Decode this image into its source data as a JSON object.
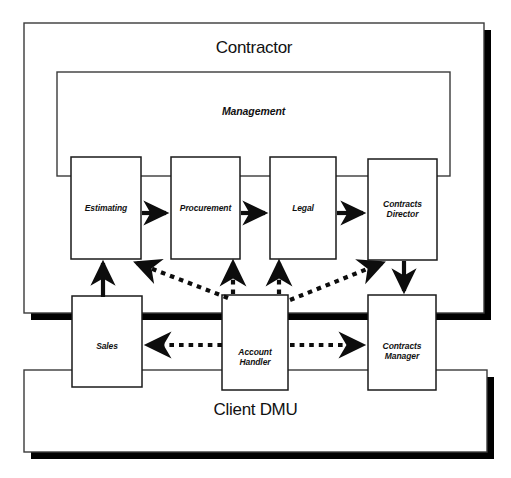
{
  "diagram": {
    "type": "organisational-relationship-diagram",
    "containers": [
      {
        "id": "contractor",
        "label": "Contractor",
        "x": 24,
        "y": 23,
        "w": 460,
        "h": 290,
        "shadow": true
      },
      {
        "id": "management",
        "label": "Management",
        "x": 57,
        "y": 72,
        "w": 393,
        "h": 104,
        "shadow": false
      },
      {
        "id": "client-dmu",
        "label": "Client DMU",
        "x": 24,
        "y": 370,
        "w": 463,
        "h": 82,
        "shadow": true
      }
    ],
    "nodes": [
      {
        "id": "estimating",
        "label": "Estimating",
        "x": 71,
        "y": 157,
        "w": 70,
        "h": 102
      },
      {
        "id": "procurement",
        "label": "Procurement",
        "x": 171,
        "y": 157,
        "w": 69,
        "h": 102
      },
      {
        "id": "legal",
        "label": "Legal",
        "x": 270,
        "y": 157,
        "w": 66,
        "h": 102
      },
      {
        "id": "contracts-director",
        "label": "Contracts\nDirector",
        "x": 368,
        "y": 159,
        "w": 69,
        "h": 101
      },
      {
        "id": "sales",
        "label": "Sales",
        "x": 72,
        "y": 296,
        "w": 70,
        "h": 91
      },
      {
        "id": "account-handler",
        "label": "Account\nHandler",
        "x": 222,
        "y": 295,
        "w": 66,
        "h": 95
      },
      {
        "id": "contracts-manager",
        "label": "Contracts\nManager",
        "x": 368,
        "y": 295,
        "w": 68,
        "h": 95
      }
    ],
    "connectors": [
      {
        "id": "estimating-to-procurement",
        "style": "solid",
        "from": "estimating",
        "to": "procurement"
      },
      {
        "id": "procurement-to-legal",
        "style": "solid",
        "from": "procurement",
        "to": "legal"
      },
      {
        "id": "legal-to-contracts-director",
        "style": "solid",
        "from": "legal",
        "to": "contracts-director"
      },
      {
        "id": "sales-to-estimating",
        "style": "solid",
        "from": "sales",
        "to": "estimating"
      },
      {
        "id": "contracts-director-to-contracts-manager",
        "style": "solid",
        "from": "contracts-director",
        "to": "contracts-manager"
      },
      {
        "id": "account-handler-to-estimating",
        "style": "dotted",
        "from": "account-handler",
        "to": "estimating"
      },
      {
        "id": "account-handler-to-procurement",
        "style": "dotted",
        "from": "account-handler",
        "to": "procurement"
      },
      {
        "id": "account-handler-to-legal",
        "style": "dotted",
        "from": "account-handler",
        "to": "legal"
      },
      {
        "id": "account-handler-to-contracts-director",
        "style": "dotted",
        "from": "account-handler",
        "to": "contracts-director"
      },
      {
        "id": "account-handler-to-sales",
        "style": "dotted",
        "from": "account-handler",
        "to": "sales"
      },
      {
        "id": "account-handler-to-contracts-manager",
        "style": "dotted",
        "from": "account-handler",
        "to": "contracts-manager"
      }
    ],
    "colors": {
      "stroke": "#1a1a1a",
      "fill": "#ffffff",
      "shadow": "#000000",
      "background": "#ffffff"
    }
  }
}
